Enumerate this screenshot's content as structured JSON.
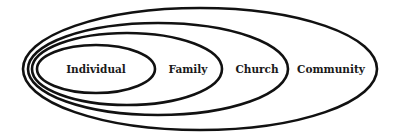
{
  "diagram": {
    "type": "nested-ellipses",
    "stroke_color": "#111111",
    "background": "#ffffff",
    "levels": [
      {
        "label": "Individual",
        "cx": 96,
        "cy": 69,
        "rx": 59,
        "ry": 24,
        "label_x": 96,
        "label_y": 73
      },
      {
        "label": "Family",
        "cx": 127,
        "cy": 69,
        "rx": 95,
        "ry": 36,
        "label_x": 188,
        "label_y": 73
      },
      {
        "label": "Church",
        "cx": 158,
        "cy": 69,
        "rx": 130,
        "ry": 46,
        "label_x": 257,
        "label_y": 73
      },
      {
        "label": "Community",
        "cx": 200,
        "cy": 69,
        "rx": 177,
        "ry": 61,
        "label_x": 331,
        "label_y": 73
      }
    ]
  }
}
